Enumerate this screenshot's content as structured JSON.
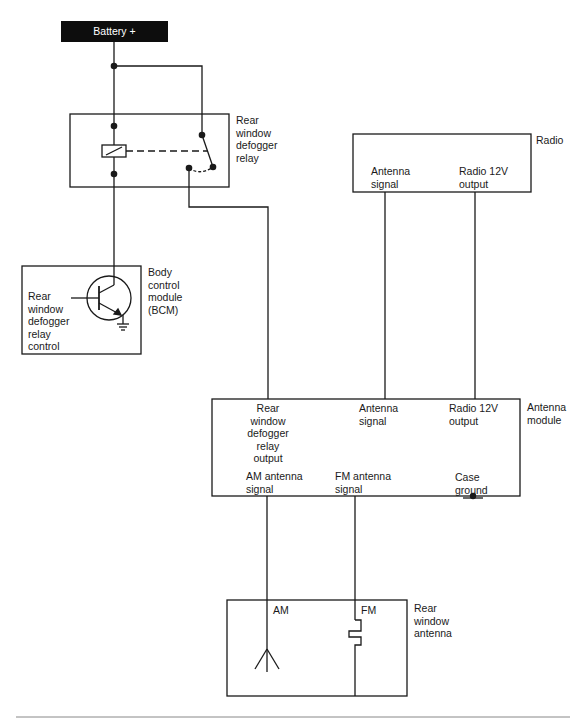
{
  "diagram": {
    "type": "wiring-schematic",
    "colors": {
      "line": "#1a1a1a",
      "background": "#ffffff",
      "battery_fill": "#0d0d0d",
      "battery_text": "#ffffff"
    },
    "battery": {
      "label": "Battery +"
    },
    "relay": {
      "label": "Rear\nwindow\ndefogger\nrelay"
    },
    "bcm": {
      "label": "Body\ncontrol\nmodule\n(BCM)",
      "inner_label": "Rear\nwindow\ndefogger\nrelay\ncontrol"
    },
    "radio": {
      "label": "Radio",
      "pins": {
        "antenna_signal": "Antenna\nsignal",
        "radio_12v": "Radio 12V\noutput"
      }
    },
    "antenna_module": {
      "label": "Antenna\nmodule",
      "pins": {
        "defogger_output": "Rear\nwindow\ndefogger\nrelay\noutput",
        "antenna_signal": "Antenna\nsignal",
        "radio_12v": "Radio 12V\noutput",
        "am_signal": "AM antenna\nsignal",
        "fm_signal": "FM antenna\nsignal",
        "case_ground": "Case\nground"
      }
    },
    "rear_window_antenna": {
      "label": "Rear\nwindow\nantenna",
      "am": "AM",
      "fm": "FM"
    }
  }
}
